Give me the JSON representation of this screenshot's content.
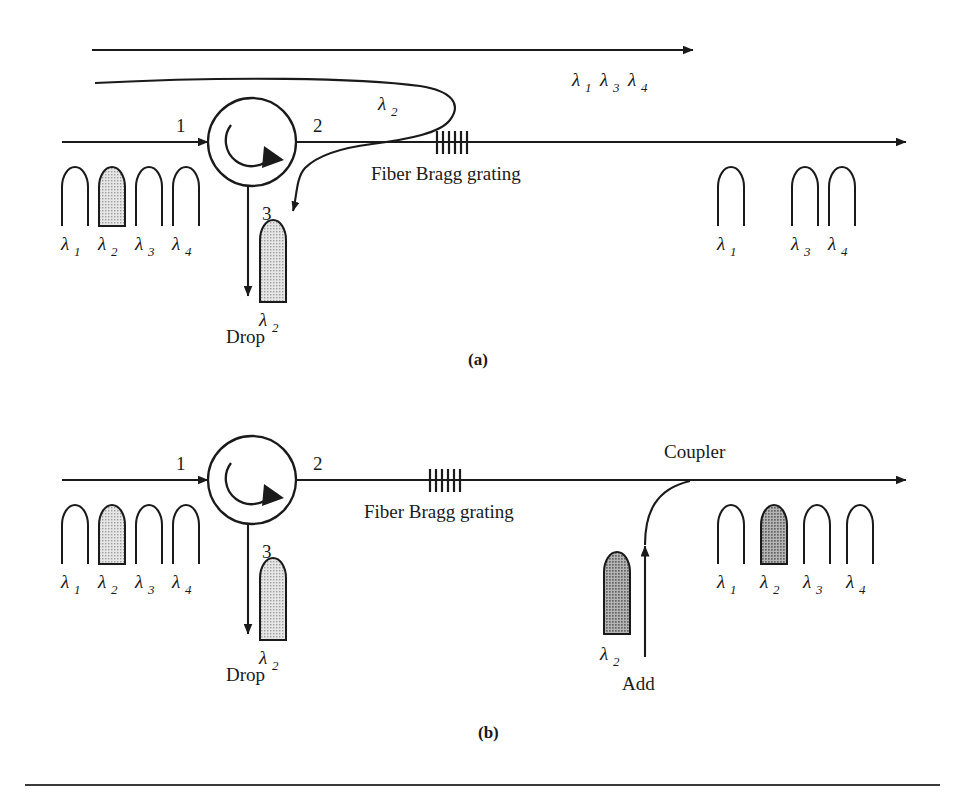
{
  "figure": {
    "bottom_rule": true,
    "colors": {
      "stroke": "#1a1a1a",
      "text": "#1a1a1a",
      "pulse_outline": "#1a1a1a",
      "pulse_fill_light": "#d2d2d2",
      "pulse_fill_dark": "#9a9a9a",
      "background": "#ffffff"
    }
  },
  "panels": [
    {
      "id": "a",
      "caption": "(a)",
      "circulator": {
        "port1": "1",
        "port2": "2",
        "port3": "3"
      },
      "grating_label": "Fiber Bragg grating",
      "drop_label": "Drop",
      "reflected_label": {
        "base": "λ",
        "sub": "2"
      },
      "through_label": "λ1 λ3 λ4",
      "through_items": [
        {
          "base": "λ",
          "sub": "1"
        },
        {
          "base": "λ",
          "sub": "3"
        },
        {
          "base": "λ",
          "sub": "4"
        }
      ],
      "input_pulses": [
        {
          "base": "λ",
          "sub": "1",
          "shaded": false
        },
        {
          "base": "λ",
          "sub": "2",
          "shaded": true
        },
        {
          "base": "λ",
          "sub": "3",
          "shaded": false
        },
        {
          "base": "λ",
          "sub": "4",
          "shaded": false
        }
      ],
      "output_pulses": [
        {
          "base": "λ",
          "sub": "1",
          "shaded": false
        },
        {
          "base": "λ",
          "sub": "3",
          "shaded": false
        },
        {
          "base": "λ",
          "sub": "4",
          "shaded": false
        }
      ],
      "drop_pulse": {
        "base": "λ",
        "sub": "2",
        "shaded": true
      }
    },
    {
      "id": "b",
      "caption": "(b)",
      "circulator": {
        "port1": "1",
        "port2": "2",
        "port3": "3"
      },
      "grating_label": "Fiber Bragg grating",
      "drop_label": "Drop",
      "add_label": "Add",
      "coupler_label": "Coupler",
      "input_pulses": [
        {
          "base": "λ",
          "sub": "1",
          "shaded": false
        },
        {
          "base": "λ",
          "sub": "2",
          "shaded": true
        },
        {
          "base": "λ",
          "sub": "3",
          "shaded": false
        },
        {
          "base": "λ",
          "sub": "4",
          "shaded": false
        }
      ],
      "output_pulses": [
        {
          "base": "λ",
          "sub": "1",
          "shaded": false
        },
        {
          "base": "λ",
          "sub": "2",
          "shaded": true
        },
        {
          "base": "λ",
          "sub": "3",
          "shaded": false
        },
        {
          "base": "λ",
          "sub": "4",
          "shaded": false
        }
      ],
      "drop_pulse": {
        "base": "λ",
        "sub": "2",
        "shaded": true
      },
      "add_pulse": {
        "base": "λ",
        "sub": "2",
        "shaded": true
      }
    }
  ]
}
